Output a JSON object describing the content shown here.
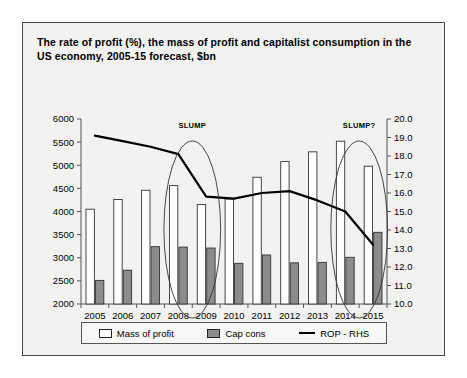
{
  "figure": {
    "title": "The rate of profit (%), the mass of profit and capitalist consumption in the US economy, 2005-15 forecast, $bn",
    "background_color": "#f2f2f0",
    "border_color": "#4a4a4a"
  },
  "legend": {
    "items": [
      {
        "label": "Mass of profit",
        "marker": "white-box-swatch",
        "color": "#ffffff"
      },
      {
        "label": "Cap cons",
        "marker": "gray-box-swatch",
        "color": "#8c8c8c"
      },
      {
        "label": "ROP - RHS",
        "marker": "black-line-swatch",
        "color": "#000000"
      }
    ]
  },
  "chart_data": {
    "type": "bar",
    "title": "The rate of profit (%), the mass of profit and capitalist consumption in the US economy, 2005-15 forecast, $bn",
    "xlabel": "",
    "ylabel": "",
    "grid": false,
    "legend_position": "bottom",
    "categories": [
      "2005",
      "2006",
      "2007",
      "2008",
      "2009",
      "2010",
      "2011",
      "2012",
      "2013",
      "2014",
      "2015"
    ],
    "left_axis": {
      "ylim": [
        2000,
        6000
      ],
      "ticks": [
        2000,
        2500,
        3000,
        3500,
        4000,
        4500,
        5000,
        5500,
        6000
      ],
      "tick_labels": [
        "2000",
        "2500",
        "3000",
        "3500",
        "4000",
        "4500",
        "5000",
        "5500",
        "6000"
      ],
      "units": "$bn"
    },
    "right_axis": {
      "ylim": [
        10.0,
        20.0
      ],
      "ticks": [
        10.0,
        11.0,
        12.0,
        13.0,
        14.0,
        15.0,
        16.0,
        17.0,
        18.0,
        19.0,
        20.0
      ],
      "tick_labels": [
        "10.0",
        "11.0",
        "12.0",
        "13.0",
        "14.0",
        "15.0",
        "16.0",
        "17.0",
        "18.0",
        "19.0",
        "20.0"
      ],
      "units": "%"
    },
    "series": [
      {
        "name": "Mass of profit",
        "kind": "bar",
        "axis": "left",
        "color": "#ffffff",
        "edge_color": "#333333",
        "values": [
          4050,
          4260,
          4460,
          4560,
          4150,
          4270,
          4740,
          5080,
          5290,
          5520,
          4980
        ]
      },
      {
        "name": "Cap cons",
        "kind": "bar",
        "axis": "left",
        "color": "#8c8c8c",
        "edge_color": "#333333",
        "values": [
          2510,
          2730,
          3240,
          3230,
          3210,
          2880,
          3060,
          2890,
          2900,
          3010,
          3550
        ]
      },
      {
        "name": "ROP - RHS",
        "kind": "line",
        "axis": "right",
        "color": "#000000",
        "values": [
          19.1,
          18.8,
          18.5,
          18.1,
          15.8,
          15.7,
          16.0,
          16.1,
          15.6,
          15.0,
          13.2
        ]
      }
    ],
    "annotations": [
      {
        "text": "SLUMP",
        "category_span": [
          "2008",
          "2009"
        ],
        "shape": "ellipse"
      },
      {
        "text": "SLUMP?",
        "category_span": [
          "2014",
          "2015"
        ],
        "shape": "ellipse"
      }
    ]
  }
}
